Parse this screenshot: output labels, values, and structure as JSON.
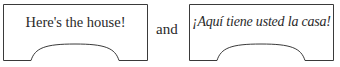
{
  "signs": [
    {
      "text": "Here's the house!",
      "language": "English",
      "style": "upright"
    },
    {
      "text": "¡Aquí tiene usted la casa!",
      "language": "Spanish",
      "style": "italic"
    }
  ],
  "connector": "and",
  "colors": {
    "stroke": "#3a3a3a",
    "text": "#2a2a2a",
    "background": "#ffffff"
  }
}
